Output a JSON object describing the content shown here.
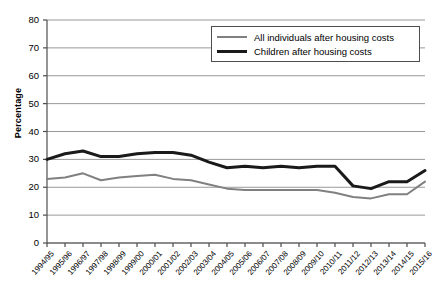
{
  "chart_data": {
    "type": "line",
    "title": "",
    "xlabel": "",
    "ylabel": "Percentage",
    "ylim": [
      0,
      80
    ],
    "ytick_step": 10,
    "yticks": [
      0,
      10,
      20,
      30,
      40,
      50,
      60,
      70,
      80
    ],
    "grid": "horizontal",
    "legend_position": "top-right",
    "categories": [
      "1994/95",
      "1995/96",
      "1996/97",
      "1997/98",
      "1998/99",
      "1999/00",
      "2000/01",
      "2001/02",
      "2002/03",
      "2003/04",
      "2004/05",
      "2005/06",
      "2006/07",
      "2007/08",
      "2008/09",
      "2009/10",
      "2010/11",
      "2011/12",
      "2012/13",
      "2013/14",
      "2014/15",
      "2015/16"
    ],
    "series": [
      {
        "name": "All individuals after housing costs",
        "color": "#808080",
        "width": 2,
        "values": [
          23,
          23.5,
          25,
          22.5,
          23.5,
          24,
          24.5,
          23,
          22.5,
          21,
          19.5,
          19,
          19,
          19,
          19,
          19,
          18,
          16.5,
          16,
          17.5,
          17.5,
          22
        ]
      },
      {
        "name": "Children after housing costs",
        "color": "#1a1a1a",
        "width": 3,
        "values": [
          30,
          32,
          33,
          31,
          31,
          32,
          32.5,
          32.5,
          31.5,
          29,
          27,
          27.5,
          27,
          27.5,
          27,
          27.5,
          27.5,
          20.5,
          19.5,
          22,
          22,
          26
        ]
      }
    ]
  },
  "axis": {
    "y_title": "Percentage"
  },
  "legend": {
    "entries": [
      {
        "label": "All individuals after housing costs",
        "style": "thin"
      },
      {
        "label": "Children after housing costs",
        "style": "thick"
      }
    ]
  }
}
